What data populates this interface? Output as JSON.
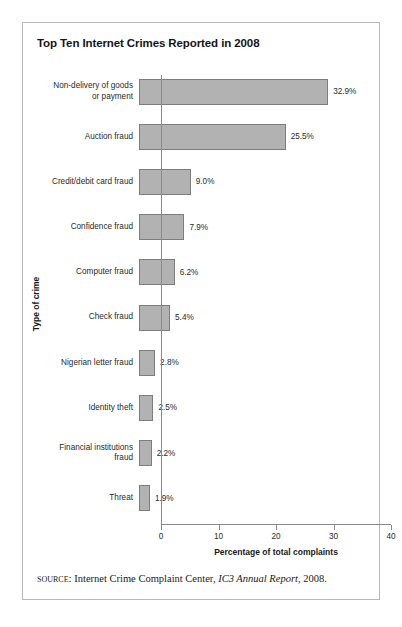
{
  "figure": {
    "title": "Top Ten Internet Crimes Reported in 2008",
    "source": {
      "kicker": "source:",
      "text_before": " Internet Crime Complaint Center, ",
      "italic": "IC3 Annual Report",
      "text_after": ", 2008."
    }
  },
  "chart_data": {
    "type": "bar",
    "orientation": "horizontal",
    "title": "Top Ten Internet Crimes Reported in 2008",
    "xlabel": "Percentage of total complaints",
    "ylabel": "Type of crime",
    "xlim": [
      0,
      40
    ],
    "xticks": [
      0,
      10,
      20,
      30,
      40
    ],
    "grid": false,
    "legend": null,
    "bar_color": "#b2b2b2",
    "bar_border_color": "#7d7d7d",
    "categories": [
      "Non-delivery of goods\nor payment",
      "Auction fraud",
      "Credit/debit card fraud",
      "Confidence fraud",
      "Computer fraud",
      "Check fraud",
      "Nigerian letter fraud",
      "Identity theft",
      "Financial institutions\nfraud",
      "Threat"
    ],
    "values": [
      32.9,
      25.5,
      9.0,
      7.9,
      6.2,
      5.4,
      2.8,
      2.5,
      2.2,
      1.9
    ],
    "value_labels": [
      "32.9%",
      "25.5%",
      "9.0%",
      "7.9%",
      "6.2%",
      "5.4%",
      "2.8%",
      "2.5%",
      "2.2%",
      "1.9%"
    ]
  }
}
